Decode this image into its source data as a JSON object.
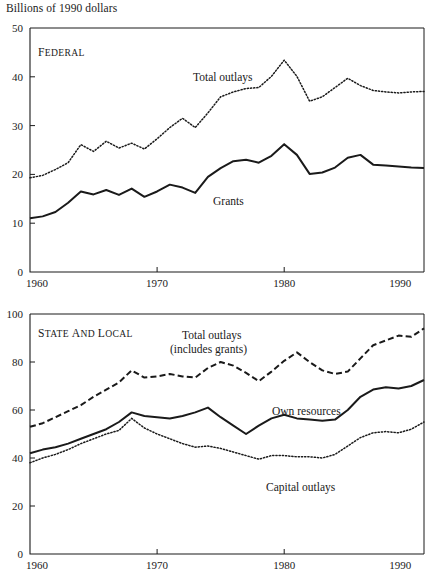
{
  "figure": {
    "title": "Billions of 1990 dollars"
  },
  "chart_data": [
    {
      "type": "line",
      "panel_id": "federal",
      "panel_label": "Federal",
      "title": "Billions of 1990 dollars",
      "xlabel": "",
      "ylabel": "Billions of 1990 dollars",
      "xlim": [
        1960,
        1991
      ],
      "ylim": [
        0,
        50
      ],
      "xticks": [
        1960,
        1970,
        1980,
        1990
      ],
      "xtick_labels": [
        "1960",
        "1970",
        "1980",
        "1990"
      ],
      "yticks": [
        0,
        10,
        20,
        30,
        40,
        50
      ],
      "ytick_labels": [
        "0",
        "10",
        "20",
        "30",
        "40",
        "50"
      ],
      "grid": false,
      "legend_position": "inline-annotations",
      "x": [
        1960,
        1961,
        1962,
        1963,
        1964,
        1965,
        1966,
        1967,
        1968,
        1969,
        1970,
        1971,
        1972,
        1973,
        1974,
        1975,
        1976,
        1977,
        1978,
        1979,
        1980,
        1981,
        1982,
        1983,
        1984,
        1985,
        1986,
        1987,
        1988,
        1989,
        1990,
        1991
      ],
      "series": [
        {
          "name": "Total outlays",
          "style": "dotted",
          "label_text": "Total outlays",
          "values": [
            19.3,
            19.8,
            21.0,
            22.4,
            26.1,
            24.7,
            26.8,
            25.4,
            26.4,
            25.2,
            27.3,
            29.6,
            31.5,
            29.6,
            32.6,
            35.9,
            36.9,
            37.6,
            37.8,
            40.1,
            43.4,
            40.1,
            35.0,
            35.9,
            37.8,
            39.7,
            38.2,
            37.2,
            36.9,
            36.7,
            36.9,
            37.0
          ]
        },
        {
          "name": "Grants",
          "style": "solid",
          "label_text": "Grants",
          "values": [
            11.0,
            11.4,
            12.3,
            14.2,
            16.5,
            15.9,
            16.8,
            15.8,
            17.1,
            15.4,
            16.5,
            17.9,
            17.3,
            16.2,
            19.5,
            21.3,
            22.7,
            23.0,
            22.4,
            23.8,
            26.2,
            24.0,
            20.1,
            20.4,
            21.4,
            23.4,
            24.0,
            22.0,
            21.8,
            21.6,
            21.4,
            21.3
          ]
        }
      ]
    },
    {
      "type": "line",
      "panel_id": "state-and-local",
      "panel_label": "State and local",
      "title": "",
      "xlabel": "",
      "ylabel": "Billions of 1990 dollars",
      "xlim": [
        1960,
        1991
      ],
      "ylim": [
        0,
        100
      ],
      "xticks": [
        1960,
        1970,
        1980,
        1990
      ],
      "xtick_labels": [
        "1960",
        "1970",
        "1980",
        "1990"
      ],
      "yticks": [
        0,
        20,
        40,
        60,
        80,
        100
      ],
      "ytick_labels": [
        "0",
        "20",
        "40",
        "60",
        "80",
        "100"
      ],
      "grid": false,
      "legend_position": "inline-annotations",
      "x": [
        1960,
        1961,
        1962,
        1963,
        1964,
        1965,
        1966,
        1967,
        1968,
        1969,
        1970,
        1971,
        1972,
        1973,
        1974,
        1975,
        1976,
        1977,
        1978,
        1979,
        1980,
        1981,
        1982,
        1983,
        1984,
        1985,
        1986,
        1987,
        1988,
        1989,
        1990,
        1991
      ],
      "series": [
        {
          "name": "Total outlays (includes grants)",
          "style": "dashed",
          "label_line1": "Total outlays",
          "label_line2": "(includes grants)",
          "values": [
            53.0,
            54.5,
            57.0,
            59.5,
            62.0,
            65.5,
            68.5,
            71.5,
            76.5,
            73.5,
            74.0,
            75.0,
            74.0,
            73.5,
            77.5,
            80.0,
            78.5,
            75.5,
            72.0,
            76.0,
            80.5,
            84.0,
            80.0,
            76.5,
            75.0,
            76.0,
            81.5,
            87.0,
            89.0,
            91.0,
            90.5,
            94.0
          ]
        },
        {
          "name": "Own resources",
          "style": "solid",
          "label_text": "Own resources",
          "values": [
            42.0,
            43.5,
            44.5,
            46.0,
            48.0,
            50.0,
            52.0,
            55.0,
            59.0,
            57.5,
            57.0,
            56.5,
            57.5,
            59.0,
            61.0,
            57.0,
            53.5,
            50.0,
            53.5,
            56.5,
            58.0,
            56.5,
            56.0,
            55.5,
            56.0,
            60.0,
            65.5,
            68.5,
            69.5,
            69.0,
            70.0,
            72.5
          ]
        },
        {
          "name": "Capital outlays",
          "style": "dotted",
          "label_text": "Capital outlays",
          "values": [
            38.0,
            40.0,
            41.5,
            43.5,
            46.0,
            48.0,
            50.0,
            51.5,
            56.5,
            52.5,
            50.0,
            48.0,
            46.0,
            44.5,
            45.0,
            44.0,
            42.5,
            41.0,
            39.5,
            41.0,
            41.0,
            40.5,
            40.5,
            40.0,
            41.5,
            45.0,
            48.5,
            50.5,
            51.0,
            50.5,
            52.0,
            55.0
          ]
        }
      ]
    }
  ]
}
